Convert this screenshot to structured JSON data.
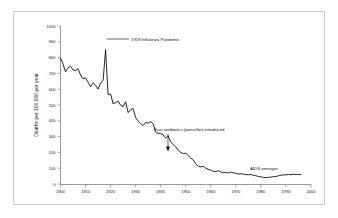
{
  "chart_data": {
    "type": "line",
    "title": "",
    "subtitle": "",
    "xlabel": "",
    "ylabel": "Deaths per 100,000 per year",
    "xlim": [
      1900,
      2000
    ],
    "ylim": [
      0,
      1000
    ],
    "xticks": [
      "1900",
      "1910",
      "1920",
      "1930",
      "1940",
      "1950",
      "1960",
      "1970",
      "1980",
      "1990",
      "2000"
    ],
    "xtick_values": [
      1900,
      1910,
      1920,
      1930,
      1940,
      1950,
      1960,
      1970,
      1980,
      1990,
      2000
    ],
    "yticks": [
      "0",
      "100",
      "200",
      "300",
      "400",
      "500",
      "600",
      "700",
      "800",
      "900",
      "1000"
    ],
    "ytick_values": [
      0,
      100,
      200,
      300,
      400,
      500,
      600,
      700,
      800,
      900,
      1000
    ],
    "grid": false,
    "legend": "none",
    "line_color": "#000000",
    "series": [
      {
        "name": "Infectious disease mortality rate",
        "x": [
          1900,
          1901,
          1902,
          1903,
          1904,
          1905,
          1906,
          1907,
          1908,
          1909,
          1910,
          1911,
          1912,
          1913,
          1914,
          1915,
          1916,
          1917,
          1918,
          1919,
          1920,
          1921,
          1922,
          1923,
          1924,
          1925,
          1926,
          1927,
          1928,
          1929,
          1930,
          1931,
          1932,
          1933,
          1934,
          1935,
          1936,
          1937,
          1938,
          1939,
          1940,
          1941,
          1942,
          1943,
          1944,
          1945,
          1946,
          1947,
          1948,
          1949,
          1950,
          1951,
          1952,
          1953,
          1954,
          1955,
          1956,
          1957,
          1958,
          1959,
          1960,
          1961,
          1962,
          1963,
          1964,
          1965,
          1966,
          1967,
          1968,
          1969,
          1970,
          1971,
          1972,
          1973,
          1974,
          1975,
          1976,
          1977,
          1978,
          1979,
          1980,
          1981,
          1982,
          1983,
          1984,
          1985,
          1986,
          1987,
          1988,
          1989,
          1990,
          1991,
          1992,
          1993,
          1994,
          1995,
          1996
        ],
        "values": [
          797,
          760,
          710,
          735,
          745,
          722,
          718,
          730,
          690,
          665,
          672,
          645,
          615,
          640,
          625,
          600,
          640,
          655,
          850,
          565,
          570,
          508,
          515,
          525,
          498,
          490,
          520,
          452,
          470,
          478,
          420,
          398,
          382,
          370,
          390,
          385,
          395,
          380,
          330,
          320,
          320,
          310,
          290,
          305,
          265,
          250,
          235,
          215,
          200,
          192,
          195,
          180,
          165,
          152,
          128,
          112,
          108,
          112,
          100,
          92,
          88,
          80,
          78,
          84,
          76,
          72,
          73,
          70,
          76,
          70,
          68,
          63,
          65,
          62,
          60,
          58,
          60,
          55,
          52,
          48,
          45,
          42,
          40,
          42,
          44,
          46,
          48,
          52,
          55,
          58,
          58,
          60,
          59,
          62,
          60,
          61,
          59
        ]
      }
    ],
    "annotations": [
      {
        "id": "influenza",
        "text": "1918 Influenza Pandemic",
        "point_x": 1918,
        "point_y": 850,
        "style": "leader-line-right"
      },
      {
        "id": "penicillin",
        "text": "First antibiotics (penicillin) introduced",
        "point_x": 1943,
        "point_y": 305,
        "style": "arrow-down"
      },
      {
        "id": "aids",
        "text": "AIDS emerges",
        "point_x": 1985,
        "point_y": 46,
        "style": "text-only"
      }
    ]
  },
  "figure": {
    "background_color": "#ffffff",
    "frame_color": "#c9c9c9",
    "axis_color": "#6f6f6f"
  }
}
